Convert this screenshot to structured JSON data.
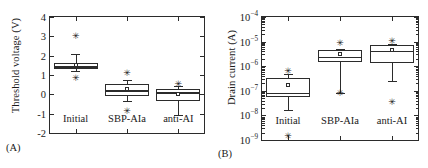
{
  "figure": {
    "panels": [
      {
        "id": "A",
        "caption": "(A)",
        "ylabel": "Threshold voltage (V)",
        "chart_data": {
          "type": "box",
          "title": "",
          "xlabel": "",
          "ylabel": "Threshold voltage (V)",
          "yscale": "linear",
          "ylim": [
            -2,
            4
          ],
          "yticks": [
            -2,
            -1,
            0,
            1,
            2,
            3,
            4
          ],
          "ytick_labels": [
            "-2",
            "-1",
            "0",
            "1",
            "2",
            "3",
            "4"
          ],
          "grid": false,
          "legend": "none",
          "categories": [
            "Initial",
            "SBP-AIa",
            "anti-AI"
          ],
          "boxes": [
            {
              "category": "Initial",
              "whisker_low": 1.2,
              "q1": 1.3,
              "median": 1.45,
              "mean": 1.5,
              "q3": 1.6,
              "whisker_high": 2.1,
              "outliers": [
                3.0,
                0.85
              ]
            },
            {
              "category": "SBP-AIa",
              "whisker_low": -0.35,
              "q1": -0.1,
              "median": 0.25,
              "mean": 0.28,
              "q3": 0.55,
              "whisker_high": 0.75,
              "outliers": [
                1.1,
                -0.85
              ]
            },
            {
              "category": "anti-AI",
              "whisker_low": -1.05,
              "q1": -0.35,
              "median": 0.1,
              "mean": 0.0,
              "q3": 0.3,
              "whisker_high": 0.45,
              "outliers": [
                0.55
              ]
            }
          ]
        }
      },
      {
        "id": "B",
        "caption": "(B)",
        "ylabel": "Drain current (A)",
        "chart_data": {
          "type": "box",
          "title": "",
          "xlabel": "",
          "ylabel": "Drain current (A)",
          "yscale": "log",
          "ylim": [
            1e-09,
            0.0001
          ],
          "yticks": [
            1e-09,
            1e-08,
            1e-07,
            1e-06,
            1e-05,
            0.0001
          ],
          "ytick_labels": [
            "10-9",
            "10-8",
            "10-7",
            "10-6",
            "10-5",
            "10-4"
          ],
          "ytick_mantissa": [
            "10",
            "10",
            "10",
            "10",
            "10",
            "10"
          ],
          "ytick_exponents": [
            "−9",
            "−8",
            "−7",
            "−6",
            "−5",
            "−4"
          ],
          "grid": false,
          "legend": "none",
          "categories": [
            "Initial",
            "SBP-AIa",
            "anti-AI"
          ],
          "boxes": [
            {
              "category": "Initial",
              "whisker_low": 1.7e-08,
              "q1": 5.5e-08,
              "median": 8.5e-08,
              "mean": 1.8e-07,
              "q3": 3.2e-07,
              "whisker_high": 5e-07,
              "outliers": [
                6.5e-07,
                1.5e-09
              ]
            },
            {
              "category": "SBP-AIa",
              "whisker_low": 8.5e-08,
              "q1": 1.5e-06,
              "median": 2.4e-06,
              "mean": 3e-06,
              "q3": 4.6e-06,
              "whisker_high": 5e-06,
              "outliers": [
                9e-06,
                8.5e-08
              ]
            },
            {
              "category": "anti-AI",
              "whisker_low": 2.4e-07,
              "q1": 1.3e-06,
              "median": 4e-06,
              "mean": 4.6e-06,
              "q3": 7e-06,
              "whisker_high": 8e-06,
              "outliers": [
                1.1e-05,
                3.5e-08
              ]
            }
          ]
        }
      }
    ]
  },
  "colors": {
    "ink": "#2b2b2b",
    "background": "#ffffff"
  }
}
